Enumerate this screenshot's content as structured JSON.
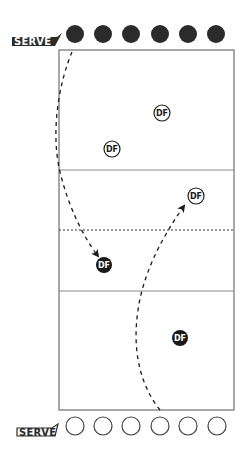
{
  "diagram": {
    "type": "volleyball-serve-receive",
    "colors": {
      "court_line": "#7a7a7a",
      "dark_player": "#2b2b2b",
      "ink": "#1a1a1a",
      "background": "#ffffff"
    },
    "court": {
      "x": 59,
      "y": 50,
      "width": 175,
      "height": 360,
      "attack_line_top_y": 170,
      "net_y": 230,
      "attack_line_bottom_y": 291
    },
    "serve_labels": {
      "top": "SERVE",
      "bottom": "SERVE"
    },
    "top_team": {
      "style": "filled",
      "players": [
        {
          "cx": 75,
          "cy": 34
        },
        {
          "cx": 103,
          "cy": 34
        },
        {
          "cx": 131,
          "cy": 34
        },
        {
          "cx": 160,
          "cy": 34
        },
        {
          "cx": 188,
          "cy": 34
        },
        {
          "cx": 216,
          "cy": 34
        }
      ]
    },
    "bottom_team": {
      "style": "open",
      "players": [
        {
          "cx": 75,
          "cy": 426
        },
        {
          "cx": 103,
          "cy": 426
        },
        {
          "cx": 131,
          "cy": 426
        },
        {
          "cx": 160,
          "cy": 426
        },
        {
          "cx": 188,
          "cy": 426
        },
        {
          "cx": 217,
          "cy": 426
        }
      ]
    },
    "markers": [
      {
        "label": "DF",
        "style": "open",
        "cx": 162,
        "cy": 113
      },
      {
        "label": "DF",
        "style": "open",
        "cx": 112,
        "cy": 149
      },
      {
        "label": "DF",
        "style": "open",
        "cx": 196,
        "cy": 196
      },
      {
        "label": "DF",
        "style": "filled",
        "cx": 104,
        "cy": 265
      },
      {
        "label": "DF",
        "style": "filled",
        "cx": 180,
        "cy": 338
      }
    ]
  }
}
